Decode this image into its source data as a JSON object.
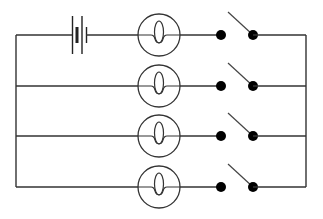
{
  "diagram": {
    "type": "circuit",
    "title": "",
    "colors": {
      "wire": "#333333",
      "terminal": "#000000",
      "background": "#ffffff"
    },
    "layout": {
      "left_rail_x": 16,
      "right_rail_x": 306,
      "rows_y": [
        35,
        86,
        136,
        187
      ]
    },
    "components": {
      "battery": {
        "label": "",
        "symbol": "battery-icon",
        "cells": 2,
        "row": 0,
        "x": 72
      },
      "lamps": [
        {
          "id": "lamp-1",
          "label": "",
          "symbol": "lamp-icon",
          "row": 0,
          "cx": 159
        },
        {
          "id": "lamp-2",
          "label": "",
          "symbol": "lamp-icon",
          "row": 1,
          "cx": 159
        },
        {
          "id": "lamp-3",
          "label": "",
          "symbol": "lamp-icon",
          "row": 2,
          "cx": 159
        },
        {
          "id": "lamp-4",
          "label": "",
          "symbol": "lamp-icon",
          "row": 3,
          "cx": 159
        }
      ],
      "switches": [
        {
          "id": "switch-1",
          "label": "",
          "state": "open",
          "row": 0
        },
        {
          "id": "switch-2",
          "label": "",
          "state": "open",
          "row": 1
        },
        {
          "id": "switch-3",
          "label": "",
          "state": "open",
          "row": 2
        },
        {
          "id": "switch-4",
          "label": "",
          "state": "open",
          "row": 3
        }
      ]
    }
  }
}
